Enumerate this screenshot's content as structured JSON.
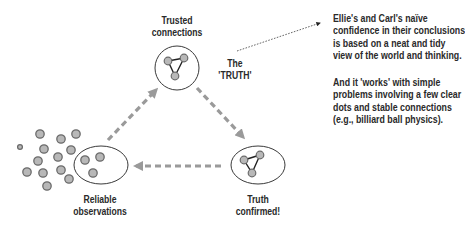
{
  "labels": {
    "trusted": [
      "Trusted",
      "connections"
    ],
    "truth_label": [
      "The",
      "'TRUTH'"
    ],
    "reliable": [
      "Reliable",
      "observations"
    ],
    "confirmed": [
      "Truth",
      "confirmed!"
    ]
  },
  "note": {
    "paragraph1": [
      "Ellie's and Carl's naïve",
      "confidence in their conclusions",
      "is based on a neat and tidy",
      "view of the world and thinking."
    ],
    "paragraph2": [
      "And it 'works' with simple",
      "problems involving a few clear",
      "dots and stable connections",
      "(e.g., billiard ball physics)."
    ]
  },
  "colors": {
    "dot_fill": "#b8b8b8",
    "dot_stroke": "#6a6a6a",
    "arrow": "#9a9a9a",
    "outline": "#3a3a3a",
    "text": "#2a2a2a"
  },
  "nodes": [
    {
      "id": "trusted-connections",
      "shape": "circle"
    },
    {
      "id": "reliable-observations",
      "shape": "ellipse"
    },
    {
      "id": "truth-confirmed",
      "shape": "ellipse"
    }
  ],
  "edges": [
    {
      "from": "reliable-observations",
      "to": "trusted-connections",
      "style": "dashed"
    },
    {
      "from": "trusted-connections",
      "to": "truth-confirmed",
      "style": "dashed"
    },
    {
      "from": "truth-confirmed",
      "to": "reliable-observations",
      "style": "dashed"
    },
    {
      "from": "truth-label",
      "to": "note",
      "style": "dotted"
    }
  ]
}
